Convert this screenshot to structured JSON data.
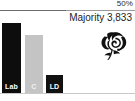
{
  "chart_data": {
    "type": "bar",
    "title": "",
    "subtitle": "",
    "xlabel": "",
    "ylabel": "",
    "categories": [
      "Lab",
      "C",
      "LD"
    ],
    "values": [
      62,
      51,
      16
    ],
    "ylim": [
      0,
      70
    ],
    "grid": false,
    "legend": "none",
    "annotations": {
      "threshold_label": "50%",
      "threshold_value": 50,
      "majority_text": "Majority 3,833",
      "majority_value": 3833
    },
    "series_colors": [
      "#0d0d0d",
      "#c4c4c4",
      "#111111"
    ]
  },
  "threshold": {
    "label": "50%"
  },
  "majority": {
    "text": "Majority 3,833"
  },
  "bars": [
    {
      "label": "Lab",
      "color": "#0d0d0d"
    },
    {
      "label": "C",
      "color": "#c4c4c4"
    },
    {
      "label": "LD",
      "color": "#111111"
    }
  ],
  "emblem": {
    "name": "labour-rose-icon",
    "color": "#111111"
  }
}
